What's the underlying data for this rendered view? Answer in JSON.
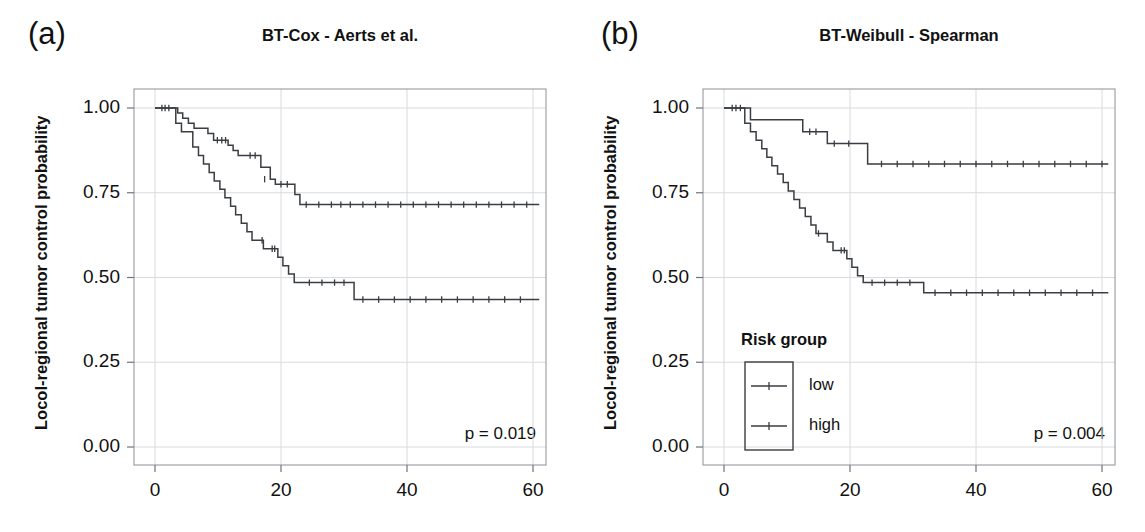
{
  "figure": {
    "background": "#ffffff",
    "line_color": "#3a3d42",
    "frame_color": "#8d9096",
    "grid_color": "#d8dade"
  },
  "panels": [
    {
      "key": "a",
      "label": "(a)",
      "title": "BT-Cox - Aerts et al.",
      "ylabel": "Locol-regional tumor control probability",
      "pvalue": "p = 0.019",
      "has_legend": false
    },
    {
      "key": "b",
      "label": "(b)",
      "title": "BT-Weibull - Spearman",
      "ylabel": "Locol-regional tumor control probability",
      "pvalue": "p = 0.004",
      "has_legend": true,
      "legend": {
        "title": "Risk group",
        "items": [
          {
            "label": "low"
          },
          {
            "label": "high"
          }
        ]
      }
    }
  ],
  "axes": {
    "y_ticks": [
      "0.00",
      "0.25",
      "0.50",
      "0.75",
      "1.00"
    ],
    "x_ticks": [
      "0",
      "20",
      "40",
      "60"
    ],
    "y_values": [
      0.0,
      0.25,
      0.5,
      0.75,
      1.0
    ],
    "x_values": [
      0,
      20,
      40,
      60
    ],
    "xlim": [
      0,
      61.5
    ],
    "ylim": [
      0,
      1.04
    ]
  },
  "chart_data": {
    "type": "line",
    "subtype": "kaplan-meier-step",
    "xlabel": "",
    "ylabel": "Locol-regional tumor control probability",
    "xlim": [
      0,
      61.5
    ],
    "ylim": [
      0,
      1.04
    ],
    "grid": true,
    "legend": {
      "title": "Risk group",
      "position": "inside-lower-left",
      "entries": [
        "low",
        "high"
      ]
    },
    "panels": [
      {
        "panel": "a",
        "title": "BT-Cox - Aerts et al.",
        "annotation": "p = 0.019",
        "series": [
          {
            "name": "low",
            "x": [
              0,
              3.0,
              3.6,
              4.4,
              5.3,
              6.2,
              8.4,
              9.3,
              11.6,
              12.4,
              13.2,
              14.0,
              16.8,
              18.3,
              19.1,
              20.5,
              22.2,
              23.0,
              61.0
            ],
            "y": [
              1.0,
              1.0,
              0.985,
              0.97,
              0.955,
              0.94,
              0.925,
              0.905,
              0.89,
              0.875,
              0.86,
              0.86,
              0.825,
              0.79,
              0.775,
              0.775,
              0.745,
              0.715,
              0.715
            ],
            "censored_x": [
              1.1,
              1.6,
              2.2,
              9.9,
              10.6,
              11.2,
              15.1,
              15.9,
              17.4,
              20.0,
              21.0,
              24.0,
              26.0,
              28.0,
              29.5,
              31.0,
              33.0,
              35.0,
              37.0,
              39.0,
              41.0,
              43.0,
              45.0,
              47.0,
              49.0,
              51.0,
              53.0,
              55.0,
              57.0,
              59.0
            ],
            "censored_y": [
              1.0,
              1.0,
              1.0,
              0.905,
              0.905,
              0.905,
              0.86,
              0.86,
              0.79,
              0.775,
              0.775,
              0.715,
              0.715,
              0.715,
              0.715,
              0.715,
              0.715,
              0.715,
              0.715,
              0.715,
              0.715,
              0.715,
              0.715,
              0.715,
              0.715,
              0.715,
              0.715,
              0.715,
              0.715,
              0.715
            ]
          },
          {
            "name": "high",
            "x": [
              0,
              2.6,
              3.3,
              4.2,
              5.0,
              6.0,
              6.9,
              7.7,
              8.6,
              9.4,
              10.3,
              11.1,
              12.0,
              12.8,
              13.7,
              14.6,
              15.4,
              16.3,
              17.2,
              18.0,
              19.5,
              20.3,
              21.2,
              22.1,
              23.0,
              31.6,
              61.0
            ],
            "y": [
              1.0,
              1.0,
              0.955,
              0.93,
              0.93,
              0.885,
              0.86,
              0.835,
              0.81,
              0.785,
              0.76,
              0.735,
              0.71,
              0.685,
              0.66,
              0.635,
              0.61,
              0.61,
              0.585,
              0.585,
              0.56,
              0.535,
              0.51,
              0.485,
              0.485,
              0.435,
              0.435
            ],
            "censored_x": [
              17.0,
              18.6,
              19.0,
              24.5,
              26.5,
              28.5,
              30.0,
              33.0,
              35.5,
              38.0,
              40.5,
              43.0,
              45.5,
              48.0,
              50.5,
              53.0,
              55.5,
              58.0
            ],
            "censored_y": [
              0.61,
              0.585,
              0.585,
              0.485,
              0.485,
              0.485,
              0.485,
              0.435,
              0.435,
              0.435,
              0.435,
              0.435,
              0.435,
              0.435,
              0.435,
              0.435,
              0.435,
              0.435
            ]
          }
        ]
      },
      {
        "panel": "b",
        "title": "BT-Weibull - Spearman",
        "annotation": "p = 0.004",
        "series": [
          {
            "name": "low",
            "x": [
              0,
              3.4,
              4.2,
              11.6,
              12.5,
              15.6,
              16.4,
              22.0,
              22.8,
              61.0
            ],
            "y": [
              1.0,
              1.0,
              0.965,
              0.965,
              0.93,
              0.93,
              0.895,
              0.895,
              0.835,
              0.835
            ],
            "censored_x": [
              1.3,
              1.9,
              2.6,
              13.6,
              14.6,
              17.5,
              19.8,
              25.0,
              27.5,
              30.0,
              32.5,
              35.0,
              37.5,
              40.0,
              42.5,
              45.0,
              47.5,
              50.0,
              52.5,
              55.0,
              57.5,
              60.0
            ],
            "censored_y": [
              1.0,
              1.0,
              1.0,
              0.93,
              0.93,
              0.895,
              0.895,
              0.835,
              0.835,
              0.835,
              0.835,
              0.835,
              0.835,
              0.835,
              0.835,
              0.835,
              0.835,
              0.835,
              0.835,
              0.835,
              0.835,
              0.835
            ]
          },
          {
            "name": "high",
            "x": [
              0,
              2.5,
              3.3,
              4.2,
              5.1,
              6.0,
              6.8,
              7.6,
              8.5,
              9.4,
              10.2,
              11.1,
              12.0,
              12.9,
              13.8,
              14.6,
              15.5,
              16.4,
              17.3,
              18.2,
              19.5,
              20.3,
              21.2,
              22.1,
              31.7,
              61.0
            ],
            "y": [
              1.0,
              1.0,
              0.955,
              0.93,
              0.905,
              0.88,
              0.855,
              0.83,
              0.805,
              0.78,
              0.755,
              0.73,
              0.705,
              0.68,
              0.655,
              0.63,
              0.63,
              0.605,
              0.58,
              0.58,
              0.555,
              0.53,
              0.505,
              0.485,
              0.455,
              0.455
            ],
            "censored_x": [
              15.0,
              18.6,
              19.1,
              23.5,
              25.5,
              27.5,
              29.5,
              33.5,
              36.0,
              38.5,
              41.0,
              43.5,
              46.0,
              48.5,
              51.0,
              53.5,
              56.0,
              58.5
            ],
            "censored_y": [
              0.63,
              0.58,
              0.58,
              0.485,
              0.485,
              0.485,
              0.485,
              0.455,
              0.455,
              0.455,
              0.455,
              0.455,
              0.455,
              0.455,
              0.455,
              0.455,
              0.455,
              0.455
            ]
          }
        ]
      }
    ]
  }
}
